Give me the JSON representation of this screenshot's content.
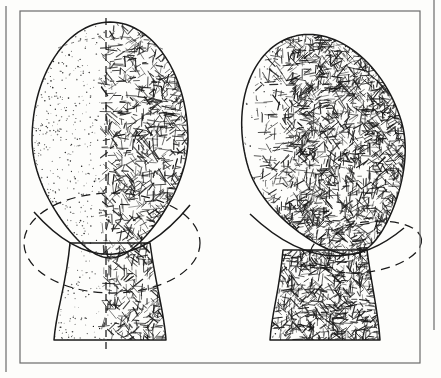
{
  "figure": {
    "medium": "pen-and-ink stipple and hatch illustration",
    "background_color": "#fdfdfb",
    "ink_color": "#1a1a1a",
    "frame": {
      "name": "plate-border",
      "inner_rect": {
        "x": 20,
        "y": 11,
        "width": 400,
        "height": 352
      },
      "outer_left_rule": {
        "x": 6,
        "y_top": 6,
        "y_bottom": 372
      },
      "outer_right_rule": {
        "x": 434,
        "y_top": 0,
        "y_bottom": 330
      },
      "stroke_color": "#6b6b6b",
      "stroke_width": 1.2
    },
    "figures": [
      {
        "id": "left-figure",
        "label": "frontal view",
        "view": "anterior",
        "head": {
          "shape": "ovoid cranium, vertical axis",
          "center_x": 110,
          "center_y": 140,
          "radius_x": 78,
          "radius_y": 118
        },
        "neck": {
          "top_y": 243,
          "bottom_y": 340,
          "top_half_width": 40,
          "bottom_half_width": 56
        },
        "midline": {
          "name": "sagittal-midline",
          "style": "dashed",
          "x": 106,
          "y_top": 18,
          "y_bottom": 352
        },
        "section_ellipse": {
          "name": "section-plane-ellipse",
          "style": "dashed",
          "center_x": 112,
          "center_y": 243,
          "radius_x": 88,
          "radius_y": 50,
          "rotation_deg": 0
        },
        "vertex_arc": {
          "name": "vertex-dashed-arc",
          "style": "dashed"
        },
        "shading": {
          "left_region": "stipple",
          "right_region": "dense-hatch",
          "boundary_x": 106
        }
      },
      {
        "id": "right-figure",
        "label": "oblique view",
        "view": "three-quarter",
        "head": {
          "shape": "ovoid cranium, tilted axis",
          "center_x": 325,
          "center_y": 145,
          "radius_x": 80,
          "radius_y": 113,
          "rotation_deg": -17
        },
        "neck": {
          "top_y": 250,
          "bottom_y": 340,
          "top_half_width": 42,
          "bottom_half_width": 55
        },
        "section_ellipse": {
          "name": "section-plane-ellipse",
          "style": "dashed",
          "center_x": 366,
          "center_y": 247,
          "radius_x": 56,
          "radius_y": 25,
          "rotation_deg": -8
        },
        "shading": {
          "left_region": "stipple",
          "right_region": "dense-hatch",
          "boundary_x": 278
        }
      }
    ],
    "texture_params": {
      "stipple_dot_count": 2100,
      "hatch_dash_count": 2600,
      "stipple_dot_radius": 0.55,
      "hatch_dash_length": 7.5,
      "hatch_stroke_width": 1.0
    }
  }
}
